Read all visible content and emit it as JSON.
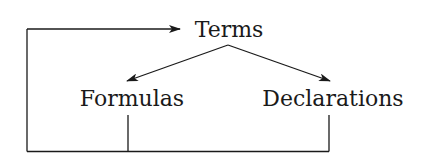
{
  "diagram": {
    "nodes": {
      "terms": {
        "label": "Terms"
      },
      "formulas": {
        "label": "Formulas"
      },
      "declarations": {
        "label": "Declarations"
      }
    },
    "edges": [
      {
        "from": "terms",
        "to": "formulas",
        "style": "arrow"
      },
      {
        "from": "terms",
        "to": "declarations",
        "style": "arrow"
      },
      {
        "from": "formulas",
        "to": "terms",
        "style": "feedback-loop-arrow"
      },
      {
        "from": "declarations",
        "to": "terms",
        "style": "feedback-loop-arrow"
      }
    ],
    "colors": {
      "line": "#1a1a1a",
      "background": "#ffffff"
    }
  }
}
